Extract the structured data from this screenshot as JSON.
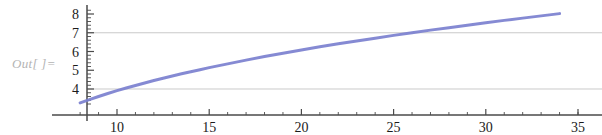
{
  "notebook": {
    "out_label": "Out[ ]="
  },
  "chart_data": {
    "type": "line",
    "title": "",
    "xlabel": "",
    "ylabel": "",
    "xlim": [
      7.2,
      35.8
    ],
    "ylim": [
      3.0,
      8.35
    ],
    "x_ticks": [
      10,
      15,
      20,
      25,
      30,
      35
    ],
    "x_tick_labels": [
      "10",
      "15",
      "20",
      "25",
      "30",
      "35"
    ],
    "x_minor_ticks": [
      8,
      9,
      11,
      12,
      13,
      14,
      16,
      17,
      18,
      19,
      21,
      22,
      23,
      24,
      26,
      27,
      28,
      29,
      31,
      32,
      33,
      34,
      35
    ],
    "y_ticks": [
      4,
      5,
      6,
      7,
      8
    ],
    "y_tick_labels": [
      "4",
      "5",
      "6",
      "7",
      "8"
    ],
    "y_minor_ticks": [
      3.2,
      3.4,
      3.6,
      3.8,
      4.2,
      4.4,
      4.6,
      4.8,
      5.2,
      5.4,
      5.6,
      5.8,
      6.2,
      6.4,
      6.6,
      6.8,
      7.2,
      7.4,
      7.6,
      7.8,
      8.2
    ],
    "gridlines_y": [
      4,
      7
    ],
    "grid": "horizontal-partial",
    "legend": "none",
    "series": [
      {
        "name": "curve",
        "color": "#7b80cf",
        "x": [
          8.0,
          8.5,
          9.0,
          9.5,
          10.0,
          10.5,
          11.0,
          11.5,
          12.0,
          12.5,
          13.0,
          13.5,
          14.0,
          14.5,
          15.0,
          16.0,
          17.0,
          18.0,
          19.0,
          20.0,
          21.0,
          22.0,
          23.0,
          24.0,
          25.0,
          26.0,
          27.0,
          28.0,
          29.0,
          30.0,
          31.0,
          32.0,
          33.0,
          34.0
        ],
        "y": [
          3.26,
          3.43,
          3.6,
          3.76,
          3.91,
          4.05,
          4.19,
          4.32,
          4.45,
          4.57,
          4.69,
          4.81,
          4.92,
          5.03,
          5.14,
          5.34,
          5.54,
          5.73,
          5.91,
          6.08,
          6.25,
          6.41,
          6.56,
          6.71,
          6.86,
          7.0,
          7.14,
          7.27,
          7.4,
          7.53,
          7.66,
          7.78,
          7.9,
          8.02
        ]
      }
    ]
  },
  "colors": {
    "curve": "#7b80cf",
    "axis": "#4a4a4a",
    "grid": "#b9b9b9",
    "out_label": "#b4b4b4"
  }
}
